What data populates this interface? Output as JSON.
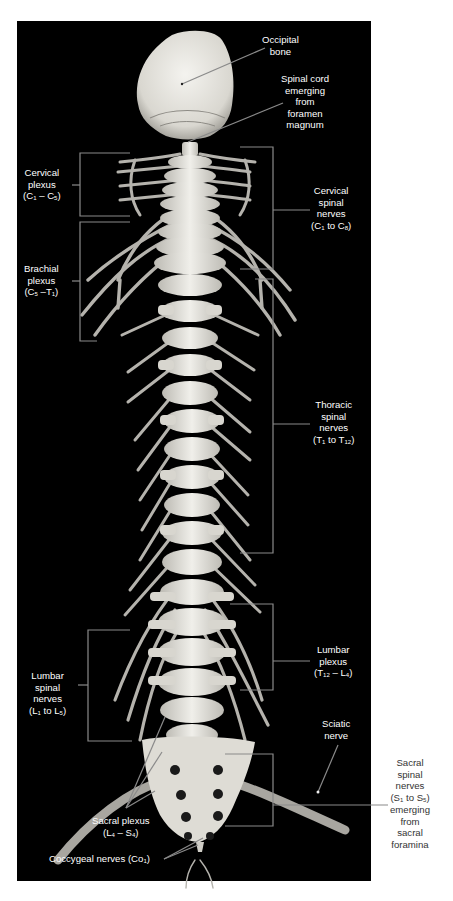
{
  "figure": {
    "type": "anatomical-photograph",
    "colors": {
      "background": "#000000",
      "page": "#ffffff",
      "bone": "#e8e6e0",
      "nerve": "#b8b6b0",
      "leader_line": "#8a8a8a",
      "label_text_on_dark": "#ffffff",
      "label_text_on_light": "#333333"
    }
  },
  "labels": {
    "occipital_bone": [
      "Occipital",
      "bone"
    ],
    "spinal_cord": [
      "Spinal cord",
      "emerging",
      "from",
      "foramen",
      "magnum"
    ],
    "cervical_plexus": {
      "lines": [
        "Cervical",
        "plexus"
      ],
      "range_a": "C",
      "sub_a": "1",
      "sep": " – ",
      "range_b": "C",
      "sub_b": "5"
    },
    "cervical_spinal_nerves": {
      "lines": [
        "Cervical",
        "spinal",
        "nerves"
      ],
      "range_a": "C",
      "sub_a": "1",
      "sep": " to ",
      "range_b": "C",
      "sub_b": "8"
    },
    "brachial_plexus": {
      "lines": [
        "Brachial",
        "plexus"
      ],
      "range_a": "C",
      "sub_a": "5",
      "sep": " –",
      "range_b": "T",
      "sub_b": "1"
    },
    "thoracic_spinal_nerves": {
      "lines": [
        "Thoracic",
        "spinal",
        "nerves"
      ],
      "range_a": "T",
      "sub_a": "1",
      "sep": " to ",
      "range_b": "T",
      "sub_b": "12"
    },
    "lumbar_plexus": {
      "lines": [
        "Lumbar",
        "plexus"
      ],
      "range_a": "T",
      "sub_a": "12",
      "sep": " – ",
      "range_b": "L",
      "sub_b": "4"
    },
    "lumbar_spinal_nerves": {
      "lines": [
        "Lumbar",
        "spinal",
        "nerves"
      ],
      "range_a": "L",
      "sub_a": "1",
      "sep": " to ",
      "range_b": "L",
      "sub_b": "5"
    },
    "sciatic_nerve": [
      "Sciatic",
      "nerve"
    ],
    "sacral_spinal_nerves": {
      "lines_before": [
        "Sacral",
        "spinal",
        "nerves"
      ],
      "range_a": "S",
      "sub_a": "1",
      "sep": " to ",
      "range_b": "S",
      "sub_b": "5",
      "lines_after": [
        "emerging",
        "from",
        "sacral",
        "foramina"
      ]
    },
    "sacral_plexus": {
      "lines": [
        "Sacral plexus"
      ],
      "range_a": "L",
      "sub_a": "4",
      "sep": " – ",
      "range_b": "S",
      "sub_b": "4"
    },
    "coccygeal_nerves": {
      "text": "Coccygeal nerves (Co",
      "sub": "1",
      "close": ")"
    }
  }
}
